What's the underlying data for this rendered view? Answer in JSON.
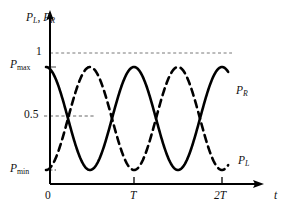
{
  "chart_data": {
    "type": "line",
    "title": "",
    "subtitle": "",
    "xlabel": "t",
    "ylabel": "P_L, P_R",
    "xlim": [
      0,
      2.45
    ],
    "ylim": [
      0,
      1.13
    ],
    "grid": "horizontal dashed reference lines at y=1 and y=0.5",
    "legend": "inline curve end labels",
    "x_ticks": [
      {
        "value": 0,
        "label": "0"
      },
      {
        "value": 1,
        "label": "T"
      },
      {
        "value": 2,
        "label": "2T"
      }
    ],
    "y_ticks": [
      {
        "value": 1.0,
        "label": "1"
      },
      {
        "value": 0.5,
        "label": "0.5"
      },
      {
        "value": 0.88,
        "label": "P_max"
      },
      {
        "value": 0.12,
        "label": "P_min"
      }
    ],
    "reference_lines": [
      {
        "y": 1.0,
        "label": "1",
        "style": "dashed",
        "extent": "full"
      },
      {
        "y": 0.5,
        "label": "0.5",
        "style": "dashed",
        "extent": "short"
      }
    ],
    "p_max": 0.88,
    "p_min": 0.12,
    "period": 1.0,
    "series": [
      {
        "name": "P_R",
        "style": "solid",
        "formula": "P_min + (P_max - P_min) * cos^2(pi*t/T)",
        "phase": "starts at maximum",
        "x": [
          0,
          0.125,
          0.25,
          0.375,
          0.5,
          0.625,
          0.75,
          0.875,
          1.0,
          1.125,
          1.25,
          1.375,
          1.5,
          1.625,
          1.75,
          1.875,
          2.0,
          2.07
        ],
        "values": [
          0.88,
          0.77,
          0.5,
          0.23,
          0.12,
          0.23,
          0.5,
          0.77,
          0.88,
          0.77,
          0.5,
          0.23,
          0.12,
          0.23,
          0.5,
          0.77,
          0.88,
          0.87
        ]
      },
      {
        "name": "P_L",
        "style": "dashed",
        "formula": "P_min + (P_max - P_min) * sin^2(pi*t/T)",
        "phase": "starts at minimum",
        "x": [
          0,
          0.125,
          0.25,
          0.375,
          0.5,
          0.625,
          0.75,
          0.875,
          1.0,
          1.125,
          1.25,
          1.375,
          1.5,
          1.625,
          1.75,
          1.875,
          2.0,
          2.07
        ],
        "values": [
          0.12,
          0.23,
          0.5,
          0.77,
          0.88,
          0.77,
          0.5,
          0.23,
          0.12,
          0.23,
          0.5,
          0.77,
          0.88,
          0.77,
          0.5,
          0.23,
          0.12,
          0.13
        ]
      }
    ],
    "colors": {
      "curve": "#000000",
      "axis": "#000000",
      "gridline": "#555555",
      "background": "#ffffff"
    }
  },
  "axes": {
    "y_title": {
      "symbol1": "P",
      "sub1": "L",
      "separator": ", ",
      "symbol2": "P",
      "sub2": "R"
    },
    "x_title": "t"
  },
  "y_labels": {
    "one": "1",
    "half": "0.5",
    "pmax": {
      "symbol": "P",
      "sub": "max"
    },
    "pmin": {
      "symbol": "P",
      "sub": "min"
    }
  },
  "x_labels": {
    "zero": "0",
    "t1": "T",
    "t2": "2T"
  },
  "curve_labels": {
    "pr": {
      "symbol": "P",
      "sub": "R"
    },
    "pl": {
      "symbol": "P",
      "sub": "L"
    }
  }
}
